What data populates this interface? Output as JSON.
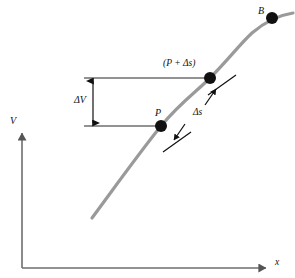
{
  "figure": {
    "type": "annotated-curve-diagram",
    "background_color": "#ffffff",
    "axes": {
      "x_label": "x",
      "y_label": "V",
      "axis_color": "#6e6e6e",
      "origin": {
        "x": 22,
        "y": 268
      },
      "x_axis_end": {
        "x": 272,
        "y": 268
      },
      "y_axis_end": {
        "x": 22,
        "y": 128
      }
    },
    "curve": {
      "name": "potential-curve",
      "color": "#9a9a9a",
      "stroke_width": 3.2,
      "path_points": [
        {
          "x": 92,
          "y": 218
        },
        {
          "x": 161,
          "y": 126
        },
        {
          "x": 210,
          "y": 78
        },
        {
          "x": 252,
          "y": 33
        },
        {
          "x": 292,
          "y": 14
        }
      ]
    },
    "points": [
      {
        "name": "point-B",
        "label": "B",
        "x": 272,
        "y": 18,
        "radius": 6.0,
        "color": "#111111"
      },
      {
        "name": "point-P-plus-ds",
        "label": "(P + Δs)",
        "x": 210,
        "y": 78,
        "radius": 6.0,
        "color": "#111111"
      },
      {
        "name": "point-P",
        "label": "P",
        "x": 161,
        "y": 126,
        "radius": 6.0,
        "color": "#111111"
      }
    ],
    "annotations": {
      "delta_v_label": "ΔV",
      "delta_s_label": "Δs",
      "p_plus_ds_label": "(P + Δs)",
      "p_label": "P",
      "b_label": "B",
      "dimension_line_color": "#6e6e6e",
      "leader_color": "#111111"
    },
    "guide_lines": {
      "upper_horizontal": {
        "x1": 84,
        "y1": 78,
        "x2": 212,
        "y2": 78
      },
      "lower_horizontal": {
        "x1": 84,
        "y1": 126,
        "x2": 163,
        "y2": 126
      },
      "delta_v_arrow": {
        "x": 93,
        "y1": 78,
        "y2": 126
      }
    }
  }
}
